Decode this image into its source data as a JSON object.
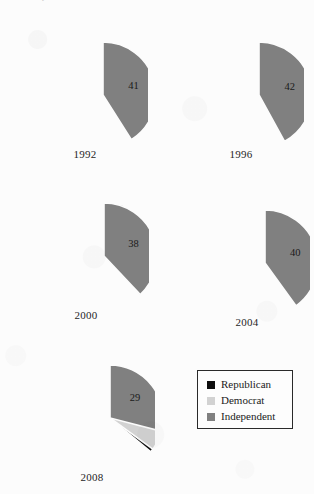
{
  "figure": {
    "top_cutoff_text": "Party Identification of the American Electorate",
    "background_color": "#fcfcfc"
  },
  "colors": {
    "republican": "#0d0d0d",
    "democrat": "#d2d2d2",
    "independent": "#808080",
    "slice_outline": "#fcfcfc",
    "label_dark": "#1a1a1a",
    "label_light": "#f2f2f2",
    "legend_border": "#2a2a2a"
  },
  "legend": {
    "items": [
      {
        "label": "Republican",
        "color": "#0d0d0d",
        "swatch_name": "republican-swatch"
      },
      {
        "label": "Democrat",
        "color": "#d2d2d2",
        "swatch_name": "democrat-swatch"
      },
      {
        "label": "Independent",
        "color": "#808080",
        "swatch_name": "independent-swatch"
      }
    ]
  },
  "chart_data": {
    "type": "pie",
    "title": "Party Identification of the American Electorate",
    "xlabel": "",
    "ylabel": "",
    "units": "percent",
    "categories": [
      "Republican",
      "Democrat",
      "Independent"
    ],
    "series": [
      {
        "name": "1992",
        "values": [
          29,
          30,
          41
        ]
      },
      {
        "name": "1996",
        "values": [
          30,
          28,
          42
        ]
      },
      {
        "name": "2000",
        "values": [
          38,
          24,
          38
        ]
      },
      {
        "name": "2004",
        "values": [
          34,
          26,
          40
        ]
      },
      {
        "name": "2008",
        "values": [
          36,
          35,
          29
        ]
      }
    ],
    "legend_position": "bottom-right",
    "start_angle_deg": 0,
    "direction": "clockwise",
    "grid": false
  },
  "pies": [
    {
      "year": "1992",
      "cx": 81,
      "cy": 77,
      "r": 53,
      "left": 22,
      "top": 18,
      "size": 126,
      "year_top": 130,
      "slices": [
        {
          "party": "Republican",
          "value": 29,
          "label": "29",
          "color": "#0d0d0d",
          "on_dark": true
        },
        {
          "party": "Democrat",
          "value": 30,
          "label": "30",
          "color": "#d2d2d2",
          "on_dark": false
        },
        {
          "party": "Independent",
          "value": 41,
          "label": "41",
          "color": "#808080",
          "on_dark": false
        }
      ]
    },
    {
      "year": "1996",
      "cx": 81,
      "cy": 77,
      "r": 53,
      "left": 178,
      "top": 18,
      "size": 126,
      "year_top": 130,
      "slices": [
        {
          "party": "Republican",
          "value": 30,
          "label": "30",
          "color": "#0d0d0d",
          "on_dark": true
        },
        {
          "party": "Democrat",
          "value": 28,
          "label": "28",
          "color": "#d2d2d2",
          "on_dark": false
        },
        {
          "party": "Independent",
          "value": 42,
          "label": "42",
          "color": "#808080",
          "on_dark": false
        }
      ]
    },
    {
      "year": "2000",
      "cx": 81,
      "cy": 77,
      "r": 53,
      "left": 23,
      "top": 179,
      "size": 126,
      "year_top": 130,
      "slices": [
        {
          "party": "Republican",
          "value": 38,
          "label": "38",
          "color": "#0d0d0d",
          "on_dark": true
        },
        {
          "party": "Democrat",
          "value": 24,
          "label": "24",
          "color": "#d2d2d2",
          "on_dark": false
        },
        {
          "party": "Independent",
          "value": 38,
          "label": "38",
          "color": "#808080",
          "on_dark": false
        }
      ]
    },
    {
      "year": "2004",
      "cx": 81,
      "cy": 77,
      "r": 53,
      "left": 184,
      "top": 186,
      "size": 126,
      "year_top": 130,
      "slices": [
        {
          "party": "Republican",
          "value": 34,
          "label": "34",
          "color": "#0d0d0d",
          "on_dark": true
        },
        {
          "party": "Democrat",
          "value": 26,
          "label": "26",
          "color": "#d2d2d2",
          "on_dark": false
        },
        {
          "party": "Independent",
          "value": 40,
          "label": "40",
          "color": "#808080",
          "on_dark": false
        }
      ]
    },
    {
      "year": "2008",
      "cx": 81,
      "cy": 77,
      "r": 53,
      "left": 29,
      "top": 341,
      "size": 126,
      "year_top": 130,
      "slices": [
        {
          "party": "Republican",
          "value": 36,
          "label": "36",
          "color": "#0d0d0d",
          "on_dark": true
        },
        {
          "party": "Democrat",
          "value": 35,
          "label": "35",
          "color": "#d2d2d2",
          "on_dark": false
        },
        {
          "party": "Independent",
          "value": 29,
          "label": "29",
          "color": "#808080",
          "on_dark": false
        }
      ]
    }
  ]
}
